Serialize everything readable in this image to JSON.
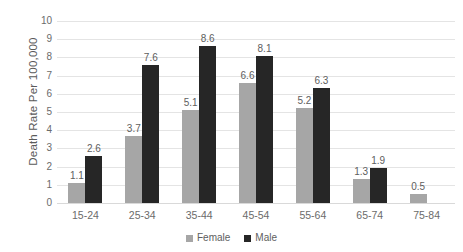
{
  "chart_data": {
    "type": "bar",
    "title": "",
    "xlabel": "",
    "ylabel": "Death Rate Per 100,000",
    "ylim": [
      0,
      10
    ],
    "ytick_step": 1,
    "yticks": [
      "10",
      "9",
      "8",
      "7",
      "6",
      "5",
      "4",
      "3",
      "2",
      "1",
      "0"
    ],
    "grid": true,
    "legend_position": "bottom",
    "categories": [
      "15-24",
      "25-34",
      "35-44",
      "45-54",
      "55-64",
      "65-74",
      "75-84"
    ],
    "series": [
      {
        "name": "Female",
        "color": "#a6a6a6",
        "values": [
          1.1,
          3.7,
          5.1,
          6.6,
          5.2,
          1.3,
          0.5
        ],
        "labels": [
          "1.1",
          "3.7",
          "5.1",
          "6.6",
          "5.2",
          "1.3",
          "0.5"
        ]
      },
      {
        "name": "Male",
        "color": "#262626",
        "values": [
          2.6,
          7.6,
          8.6,
          8.1,
          6.3,
          1.9,
          null
        ],
        "labels": [
          "2.6",
          "7.6",
          "8.6",
          "8.1",
          "6.3",
          "1.9",
          ""
        ]
      }
    ]
  },
  "legend": {
    "items": [
      {
        "label": "Female",
        "swatch": "female-swatch"
      },
      {
        "label": "Male",
        "swatch": "male-swatch"
      }
    ]
  },
  "colors": {
    "female": "#a6a6a6",
    "male": "#262626",
    "gridline": "#e4e4e4",
    "text": "#5e5e5e",
    "background": "#ffffff"
  }
}
